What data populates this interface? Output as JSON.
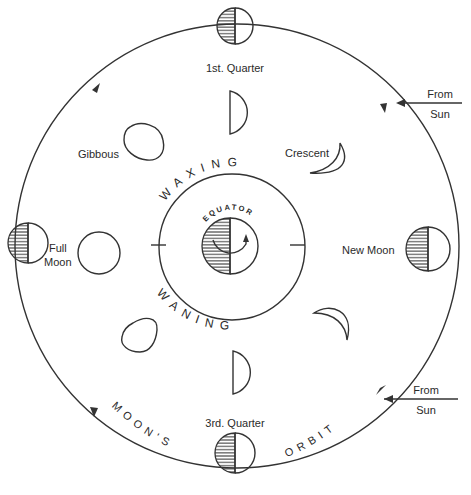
{
  "diagram": {
    "orbit_label": [
      "MOON'S",
      "ORBIT"
    ],
    "inner_labels": {
      "waxing": "WAXING",
      "waning": "WANING",
      "equator": "EQUATOR"
    },
    "sun_labels": [
      {
        "line1": "From",
        "line2": "Sun"
      },
      {
        "line1": "From",
        "line2": "Sun"
      }
    ],
    "phases": [
      {
        "name": "1st. Quarter",
        "position": "top"
      },
      {
        "name": "Gibbous",
        "position": "upper-left"
      },
      {
        "name": "Crescent",
        "position": "upper-right"
      },
      {
        "name": "Full Moon",
        "position": "left",
        "label_line1": "Full",
        "label_line2": "Moon"
      },
      {
        "name": "New Moon",
        "position": "right"
      },
      {
        "name": "3rd. Quarter",
        "position": "bottom"
      }
    ],
    "colors": {
      "line": "#333333",
      "background": "#ffffff"
    }
  }
}
